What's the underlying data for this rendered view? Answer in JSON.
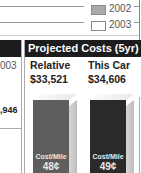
{
  "legend": {
    "items": [
      {
        "label": "2002",
        "swatch_color": "#a9a9a9"
      },
      {
        "label": "2003",
        "swatch_color": "#ffffff"
      }
    ]
  },
  "left_panel": {
    "partial_label": "003",
    "partial_value": ",946"
  },
  "projected_costs": {
    "title": "Projected Costs (5yr)",
    "columns": [
      {
        "label": "Relative",
        "value": "$33,521",
        "cost_per_mile_label": "Cost/Mile",
        "cost_per_mile": "48¢",
        "bar_color": "#5e5e5e"
      },
      {
        "label": "This Car",
        "value": "$34,606",
        "cost_per_mile_label": "Cost/Mile",
        "cost_per_mile": "49¢",
        "bar_color": "#2a2a2a"
      }
    ]
  },
  "colors": {
    "header_bg": "#1c1c1c",
    "header_text": "#ffffff"
  }
}
